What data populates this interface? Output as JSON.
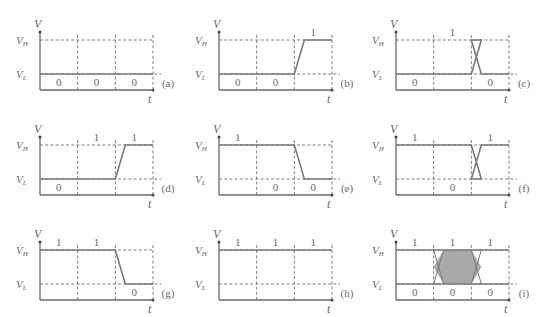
{
  "labels": {
    "v_axis": "V",
    "t_axis": "t",
    "vh": "V",
    "vh_sub": "H",
    "vl": "V",
    "vl_sub": "L"
  },
  "colors": {
    "line": "#7a7a7a",
    "axis": "#6a6a6a",
    "shade": "#a9a9a9"
  },
  "panels": [
    {
      "id": "a",
      "tag": "(a)",
      "bits": [
        "0",
        "0",
        "0"
      ],
      "bit_pos": [
        "low",
        "low",
        "low"
      ],
      "levels": [
        0,
        0,
        0,
        0
      ]
    },
    {
      "id": "b",
      "tag": "(b)",
      "bits": [
        "0",
        "0",
        "1"
      ],
      "bit_pos": [
        "low",
        "low",
        "high"
      ],
      "levels": [
        0,
        0,
        0,
        1
      ]
    },
    {
      "id": "c",
      "tag": "(c)",
      "bits": [
        "0",
        "1",
        "0"
      ],
      "bit_pos": [
        "low",
        "high",
        "low"
      ],
      "levels": [
        0,
        0,
        1,
        0
      ]
    },
    {
      "id": "d",
      "tag": "(d)",
      "bits": [
        "0",
        "1",
        "1"
      ],
      "bit_pos": [
        "low",
        "high",
        "high"
      ],
      "levels": [
        0,
        0,
        1,
        1
      ]
    },
    {
      "id": "e",
      "tag": "(e)",
      "bits": [
        "1",
        "0",
        "0"
      ],
      "bit_pos": [
        "high",
        "low",
        "low"
      ],
      "levels": [
        1,
        1,
        0,
        0
      ]
    },
    {
      "id": "f",
      "tag": "(f)",
      "bits": [
        "1",
        "0",
        "1"
      ],
      "bit_pos": [
        "high",
        "low",
        "high"
      ],
      "levels": [
        1,
        1,
        0,
        1
      ]
    },
    {
      "id": "g",
      "tag": "(g)",
      "bits": [
        "1",
        "1",
        "0"
      ],
      "bit_pos": [
        "high",
        "high",
        "low"
      ],
      "levels": [
        1,
        1,
        1,
        0
      ]
    },
    {
      "id": "h",
      "tag": "(h)",
      "bits": [
        "1",
        "1",
        "1"
      ],
      "bit_pos": [
        "high",
        "high",
        "high"
      ],
      "levels": [
        1,
        1,
        1,
        1
      ]
    },
    {
      "id": "i",
      "tag": "(i)",
      "bits_high": [
        "1",
        "1",
        "1"
      ],
      "bits_low": [
        "0",
        "0",
        "0"
      ],
      "eye": true
    }
  ]
}
